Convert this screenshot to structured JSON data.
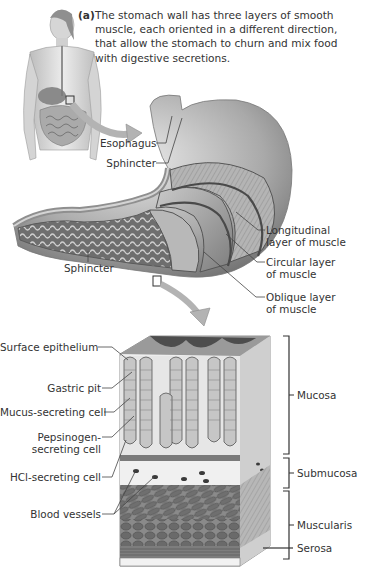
{
  "figure": {
    "panel_tag": "(a)",
    "caption": "The stomach wall has three layers of smooth muscle, each oriented in a different direction, that allow the stomach to churn and mix food with digestive secretions.",
    "caption_lines": [
      "The stomach wall has three layers of smooth",
      "muscle, each oriented in a different direction,",
      "that allow the stomach to churn and mix food",
      "with digestive secretions."
    ]
  },
  "stomach_labels": {
    "esophagus": "Esophagus",
    "sphincter_upper": "Sphincter",
    "sphincter_lower": "Sphincter",
    "longitudinal": [
      "Longitudinal",
      "layer of muscle"
    ],
    "circular": [
      "Circular layer",
      "of muscle"
    ],
    "oblique": [
      "Oblique layer",
      "of muscle"
    ]
  },
  "wall_labels": {
    "left": {
      "surface_epithelium": "Surface epithelium",
      "gastric_pit": "Gastric pit",
      "mucus_cell": "Mucus-secreting cell",
      "pepsinogen_cell": [
        "Pepsinogen-",
        "secreting cell"
      ],
      "hcl_cell": "HCl-secreting cell",
      "blood_vessels": "Blood vessels"
    },
    "right": {
      "mucosa": "Mucosa",
      "submucosa": "Submucosa",
      "muscularis": "Muscularis",
      "serosa": "Serosa"
    }
  },
  "colors": {
    "arrow": "#a9a9a9",
    "line": "#4a4a4a",
    "tissue_dark": "#5a5a5a",
    "tissue_light": "#d8d8d8"
  }
}
